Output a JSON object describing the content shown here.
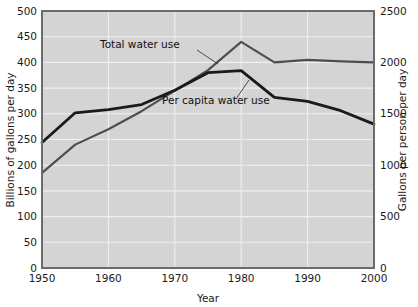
{
  "chart_data": {
    "type": "line",
    "title": "",
    "xlabel": "Year",
    "ylabel": "Billions of gallons per day",
    "ylabel_right": "Gallons per person per day",
    "xlim": [
      1950,
      2000
    ],
    "ylim": [
      0,
      500
    ],
    "ylim_right": [
      0,
      2500
    ],
    "grid": true,
    "legend_position": "inline-annotations",
    "plot_background": "#d4d4d4",
    "x_ticks": [
      "1950",
      "1960",
      "1970",
      "1980",
      "1990",
      "2000"
    ],
    "x_tick_values": [
      1950,
      1960,
      1970,
      1980,
      1990,
      2000
    ],
    "y_ticks_left": [
      "0",
      "50",
      "100",
      "150",
      "200",
      "250",
      "300",
      "350",
      "400",
      "450",
      "500"
    ],
    "y_tick_values_left": [
      0,
      50,
      100,
      150,
      200,
      250,
      300,
      350,
      400,
      450,
      500
    ],
    "y_ticks_right": [
      "0",
      "500",
      "1000",
      "1500",
      "2000",
      "2500"
    ],
    "y_tick_values_right": [
      0,
      500,
      1000,
      1500,
      2000,
      2500
    ],
    "series": [
      {
        "name": "Total water use",
        "label": "Total water use",
        "axis": "left",
        "units": "billions of gallons per day",
        "color": "#4d4d4d",
        "stroke_width": 2.1,
        "x": [
          1950,
          1955,
          1960,
          1965,
          1970,
          1975,
          1980,
          1985,
          1990,
          1995,
          2000
        ],
        "values": [
          185,
          240,
          270,
          305,
          345,
          385,
          440,
          400,
          405,
          402,
          400
        ]
      },
      {
        "name": "Per capita water use",
        "label": "Per capita water use",
        "axis": "right",
        "units": "gallons per person per day",
        "color": "#1a1a1a",
        "stroke_width": 2.8,
        "x": [
          1950,
          1955,
          1960,
          1965,
          1970,
          1975,
          1980,
          1985,
          1990,
          1995,
          2000
        ],
        "values": [
          1220,
          1510,
          1540,
          1590,
          1730,
          1900,
          1920,
          1660,
          1620,
          1530,
          1400
        ],
        "values_left_scale": [
          244,
          302,
          308,
          318,
          346,
          380,
          384,
          332,
          324,
          306,
          280
        ]
      }
    ],
    "annotations": [
      {
        "text": "Total water use",
        "label_x": 100,
        "label_y": 48,
        "leader_from_x": 197,
        "leader_from_y": 50,
        "leader_to_x": 218,
        "leader_to_y": 64
      },
      {
        "text": "Per capita water use",
        "label_x": 162,
        "label_y": 104,
        "leader_from_x": 236,
        "leader_from_y": 99,
        "leader_to_x": 249,
        "leader_to_y": 80
      }
    ]
  }
}
